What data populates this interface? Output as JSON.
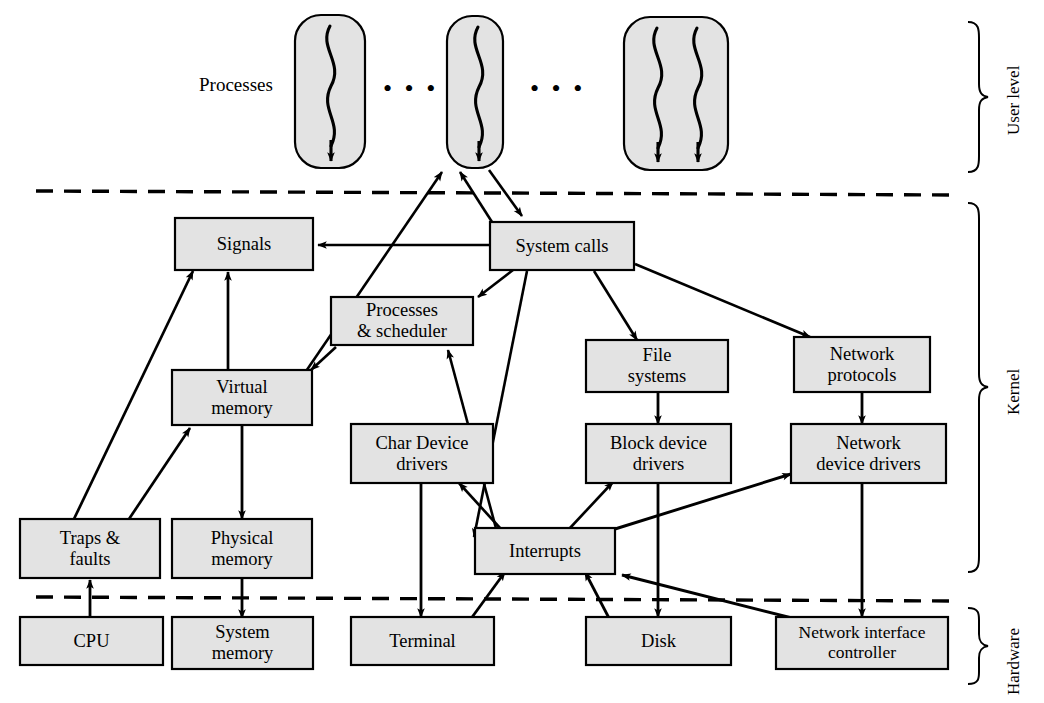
{
  "diagram": {
    "colors": {
      "box_fill": "#e3e3e3",
      "box_stroke": "#000000",
      "arrow": "#000000",
      "divider": "#000000",
      "background": "#ffffff"
    },
    "side_labels": [
      {
        "name": "user-level",
        "text": "User level"
      },
      {
        "name": "kernel",
        "text": "Kernel"
      },
      {
        "name": "hardware",
        "text": "Hardware"
      }
    ],
    "annotations": [
      {
        "name": "processes-label",
        "text": "Processes"
      }
    ],
    "ellipses": [
      {
        "name": "ellipsis-1",
        "text": "• • •"
      },
      {
        "name": "ellipsis-2",
        "text": "• • •"
      }
    ],
    "process_boxes": [
      {
        "name": "process-box-1",
        "threads": 1
      },
      {
        "name": "process-box-2",
        "threads": 1
      },
      {
        "name": "process-box-3",
        "threads": 2
      }
    ],
    "boxes": [
      {
        "id": "signals",
        "label": "Signals",
        "layer": "kernel"
      },
      {
        "id": "system_calls",
        "label": "System calls",
        "layer": "kernel"
      },
      {
        "id": "processes_sched",
        "label": "Processes\n& scheduler",
        "layer": "kernel"
      },
      {
        "id": "file_systems",
        "label": "File\nsystems",
        "layer": "kernel"
      },
      {
        "id": "network_proto",
        "label": "Network\nprotocols",
        "layer": "kernel"
      },
      {
        "id": "virtual_memory",
        "label": "Virtual\nmemory",
        "layer": "kernel"
      },
      {
        "id": "char_drivers",
        "label": "Char Device\ndrivers",
        "layer": "kernel"
      },
      {
        "id": "block_drivers",
        "label": "Block device\ndrivers",
        "layer": "kernel"
      },
      {
        "id": "net_drivers",
        "label": "Network\ndevice drivers",
        "layer": "kernel"
      },
      {
        "id": "traps_faults",
        "label": "Traps &\nfaults",
        "layer": "kernel"
      },
      {
        "id": "physical_memory",
        "label": "Physical\nmemory",
        "layer": "kernel"
      },
      {
        "id": "interrupts",
        "label": "Interrupts",
        "layer": "kernel"
      },
      {
        "id": "cpu",
        "label": "CPU",
        "layer": "hardware"
      },
      {
        "id": "system_memory",
        "label": "System\nmemory",
        "layer": "hardware"
      },
      {
        "id": "terminal",
        "label": "Terminal",
        "layer": "hardware"
      },
      {
        "id": "disk",
        "label": "Disk",
        "layer": "hardware"
      },
      {
        "id": "nic",
        "label": "Network interface\ncontroller",
        "layer": "hardware"
      }
    ],
    "edges": [
      {
        "from": "system_calls",
        "to": "process_box_2"
      },
      {
        "from": "system_calls",
        "to": "signals"
      },
      {
        "from": "system_calls",
        "to": "processes_sched"
      },
      {
        "from": "system_calls",
        "to": "virtual_memory"
      },
      {
        "from": "system_calls",
        "to": "file_systems"
      },
      {
        "from": "system_calls",
        "to": "network_proto"
      },
      {
        "from": "process_box_2",
        "to": "system_calls"
      },
      {
        "from": "processes_sched",
        "to": "virtual_memory"
      },
      {
        "from": "processes_sched",
        "to": "process_box_2"
      },
      {
        "from": "interrupts",
        "to": "processes_sched"
      },
      {
        "from": "interrupts",
        "to": "char_drivers"
      },
      {
        "from": "interrupts",
        "to": "block_drivers"
      },
      {
        "from": "interrupts",
        "to": "net_drivers"
      },
      {
        "from": "file_systems",
        "to": "block_drivers"
      },
      {
        "from": "network_proto",
        "to": "net_drivers"
      },
      {
        "from": "virtual_memory",
        "to": "physical_memory"
      },
      {
        "from": "physical_memory",
        "to": "system_memory"
      },
      {
        "from": "traps_faults",
        "to": "signals"
      },
      {
        "from": "traps_faults",
        "to": "virtual_memory"
      },
      {
        "from": "cpu",
        "to": "traps_faults"
      },
      {
        "from": "terminal",
        "to": "interrupts"
      },
      {
        "from": "disk",
        "to": "interrupts"
      },
      {
        "from": "nic",
        "to": "interrupts"
      },
      {
        "from": "char_drivers",
        "to": "terminal"
      },
      {
        "from": "block_drivers",
        "to": "disk"
      },
      {
        "from": "net_drivers",
        "to": "nic"
      }
    ]
  }
}
